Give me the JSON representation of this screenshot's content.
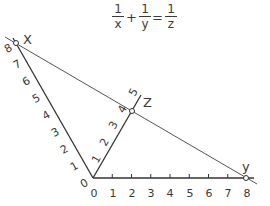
{
  "equation": {
    "terms": [
      {
        "numerator": "1",
        "denominator": "x"
      },
      {
        "numerator": "1",
        "denominator": "y"
      },
      {
        "numerator": "1",
        "denominator": "z"
      }
    ],
    "operators": [
      "+",
      "="
    ]
  },
  "axes": {
    "x": {
      "label": "X",
      "ticks": [
        "0",
        "1",
        "2",
        "3",
        "4",
        "5",
        "6",
        "7",
        "8"
      ],
      "origin": [
        93,
        178
      ],
      "end": [
        16,
        43
      ],
      "marked_value": "8"
    },
    "y": {
      "label": "y",
      "ticks": [
        "0",
        "1",
        "2",
        "3",
        "4",
        "5",
        "6",
        "7",
        "8"
      ],
      "origin": [
        93,
        178
      ],
      "end": [
        247,
        178
      ],
      "marked_value": "8"
    },
    "z": {
      "label": "Z",
      "ticks": [
        "1",
        "2",
        "3",
        "4",
        "5"
      ],
      "origin": [
        93,
        178
      ],
      "step": [
        9.75,
        -16.75
      ],
      "marked_value": "4"
    }
  },
  "isopleth": {
    "from": "X=8",
    "through": "Z=4",
    "to": "y=8"
  },
  "colors": {
    "ink": "#3a3a3a",
    "background": "#ffffff"
  }
}
